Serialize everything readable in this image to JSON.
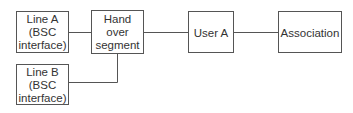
{
  "diagram": {
    "type": "block-diagram",
    "nodes": [
      {
        "id": "line_a",
        "lines": [
          "Line A",
          "(BSC",
          "interface)"
        ]
      },
      {
        "id": "handover",
        "lines": [
          "Hand",
          "over",
          "segment"
        ]
      },
      {
        "id": "line_b",
        "lines": [
          "Line B",
          "(BSC",
          "interface)"
        ]
      },
      {
        "id": "user_a",
        "lines": [
          "User A"
        ]
      },
      {
        "id": "association",
        "lines": [
          "Association"
        ]
      }
    ],
    "edges": [
      {
        "from": "line_a",
        "to": "handover"
      },
      {
        "from": "line_b",
        "to": "handover"
      },
      {
        "from": "handover",
        "to": "user_a"
      },
      {
        "from": "user_a",
        "to": "association"
      }
    ],
    "colors": {
      "stroke": "#555555",
      "text": "#333333",
      "background": "#ffffff"
    }
  }
}
